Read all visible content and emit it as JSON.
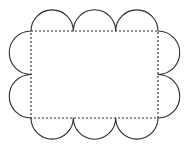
{
  "figure": {
    "title": "Scalloped rectangle outline with inscribed dashed rectangle",
    "canvas": {
      "width": 190,
      "height": 149,
      "background": "#ffffff"
    }
  },
  "geometry": {
    "rect": {
      "left": 31,
      "top": 31,
      "right": 158,
      "bottom": 118,
      "width": 127,
      "height": 87
    },
    "scallops": {
      "top_count": 3,
      "bottom_count": 3,
      "left_count": 2,
      "right_count": 2,
      "top_radius": 21.2,
      "bottom_radius": 21.2,
      "left_radius": 21.8,
      "right_radius": 21.8,
      "top_junctions_x": [
        31,
        73.3,
        115.7,
        158
      ],
      "bottom_junctions_x": [
        31,
        73.3,
        115.7,
        158
      ],
      "left_junctions_y": [
        31,
        74.5,
        118
      ],
      "right_junctions_y": [
        31,
        74.5,
        118
      ]
    },
    "extents": {
      "min_x": 9,
      "max_x": 180,
      "min_y": 10,
      "max_y": 140
    }
  },
  "style": {
    "outline_color": "#2b2b2b",
    "outline_width": 1.1,
    "dash_color": "#2b2b2b",
    "dash_width": 1.1,
    "dash_pattern": "2,2",
    "fill_color": "#ffffff"
  },
  "paths": {
    "scallop_outline": "M 31 31 A 21.15 21.15 0 0 1 73.3 31 A 21.2 21.2 0 0 1 115.7 31 A 21.15 21.15 0 0 1 158 31 A 21.75 21.75 0 0 1 158 74.5 A 21.75 21.75 0 0 1 158 118 A 21.15 21.15 0 0 1 115.7 118 A 21.2 21.2 0 0 1 73.3 118 A 21.15 21.15 0 0 1 31 118 A 21.75 21.75 0 0 1 31 74.5 A 21.75 21.75 0 0 1 31 31 Z",
    "inner_rect": "M 31 31 L 158 31 L 158 118 L 31 118 Z"
  }
}
